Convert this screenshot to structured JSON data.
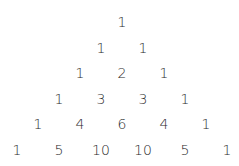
{
  "layout": {
    "center_x": 122,
    "top_y": 22,
    "row_spacing": 25.6,
    "col_spacing": 42
  },
  "rows": [
    [
      1
    ],
    [
      1,
      1
    ],
    [
      1,
      2,
      1
    ],
    [
      1,
      3,
      3,
      1
    ],
    [
      1,
      4,
      6,
      4,
      1
    ],
    [
      1,
      5,
      10,
      10,
      5,
      1
    ]
  ]
}
